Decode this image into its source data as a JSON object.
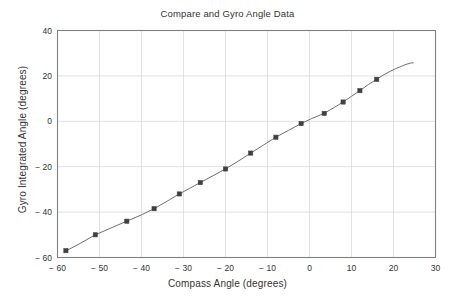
{
  "chart_data": {
    "type": "line",
    "title": "Compare and Gyro Angle Data",
    "xlabel": "Compass Angle (degrees)",
    "ylabel": "Gyro Integrated Angle (degrees)",
    "xlim": [
      -60,
      30
    ],
    "ylim": [
      -60,
      40
    ],
    "xticks": [
      -60,
      -50,
      -40,
      -30,
      -20,
      -10,
      0,
      10,
      20,
      30
    ],
    "xtick_labels": [
      "− 60",
      "− 50",
      "− 40",
      "− 30",
      "− 20",
      "− 10",
      "0",
      "10",
      "20",
      "30"
    ],
    "yticks": [
      -60,
      -40,
      -20,
      0,
      20,
      40
    ],
    "ytick_labels": [
      "− 60",
      "− 40",
      "− 20",
      "0",
      "20",
      "40"
    ],
    "grid": true,
    "legend": null,
    "line_color": "#707070",
    "marker_color": "#404040",
    "grid_color": "#d9d9d9",
    "axis_color": "#808080",
    "series": [
      {
        "name": "Gyro Integrated Angle vs Compass Angle",
        "marker": "square",
        "markers": [
          {
            "x": -58.0,
            "y": -57.0
          },
          {
            "x": -51.0,
            "y": -50.0
          },
          {
            "x": -43.5,
            "y": -44.0
          },
          {
            "x": -37.0,
            "y": -38.5
          },
          {
            "x": -31.0,
            "y": -32.0
          },
          {
            "x": -26.0,
            "y": -27.0
          },
          {
            "x": -20.0,
            "y": -21.0
          },
          {
            "x": -14.0,
            "y": -14.0
          },
          {
            "x": -8.0,
            "y": -7.0
          },
          {
            "x": -2.0,
            "y": -1.0
          },
          {
            "x": 3.5,
            "y": 3.5
          },
          {
            "x": 8.0,
            "y": 8.5
          },
          {
            "x": 12.0,
            "y": 13.5
          },
          {
            "x": 16.0,
            "y": 18.5
          }
        ],
        "line": [
          {
            "x": -58.2,
            "y": -57.3
          },
          {
            "x": -55.0,
            "y": -54.2
          },
          {
            "x": -51.0,
            "y": -50.0
          },
          {
            "x": -47.0,
            "y": -46.8
          },
          {
            "x": -43.5,
            "y": -44.0
          },
          {
            "x": -40.0,
            "y": -41.2
          },
          {
            "x": -37.0,
            "y": -38.5
          },
          {
            "x": -34.0,
            "y": -35.3
          },
          {
            "x": -31.0,
            "y": -32.0
          },
          {
            "x": -28.5,
            "y": -29.5
          },
          {
            "x": -26.0,
            "y": -27.0
          },
          {
            "x": -23.0,
            "y": -24.0
          },
          {
            "x": -20.0,
            "y": -21.0
          },
          {
            "x": -17.0,
            "y": -17.6
          },
          {
            "x": -14.0,
            "y": -14.0
          },
          {
            "x": -11.0,
            "y": -10.5
          },
          {
            "x": -8.0,
            "y": -7.0
          },
          {
            "x": -5.0,
            "y": -4.0
          },
          {
            "x": -2.0,
            "y": -1.0
          },
          {
            "x": 0.5,
            "y": 1.2
          },
          {
            "x": 3.5,
            "y": 3.5
          },
          {
            "x": 6.0,
            "y": 6.2
          },
          {
            "x": 8.0,
            "y": 8.5
          },
          {
            "x": 10.0,
            "y": 11.0
          },
          {
            "x": 12.0,
            "y": 13.5
          },
          {
            "x": 14.0,
            "y": 16.2
          },
          {
            "x": 16.0,
            "y": 18.5
          },
          {
            "x": 17.5,
            "y": 20.3
          },
          {
            "x": 19.0,
            "y": 21.8
          },
          {
            "x": 20.5,
            "y": 23.2
          },
          {
            "x": 22.0,
            "y": 24.3
          },
          {
            "x": 23.0,
            "y": 25.1
          },
          {
            "x": 24.0,
            "y": 25.6
          },
          {
            "x": 24.7,
            "y": 25.8
          }
        ]
      }
    ]
  }
}
